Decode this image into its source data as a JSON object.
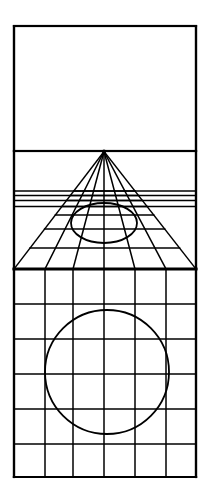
{
  "figure": {
    "title": "One-point perspective construction diagram",
    "background_color": "#ffffff",
    "stroke_color": "#000000"
  },
  "canvas": {
    "width": 209,
    "height": 499
  },
  "geometry": {
    "frame": {
      "left": 14,
      "right": 196,
      "top": 26,
      "bottom": 477,
      "stroke_width": 2.2
    },
    "horizon_line": {
      "y": 151,
      "stroke_width": 2.2,
      "label": "horizon-line"
    },
    "ground_line": {
      "y": 269,
      "stroke_width": 3.0,
      "label": "ground-line"
    },
    "vanishing_point": {
      "x": 104,
      "y": 151.5,
      "radius": 2.0,
      "label": "vanishing-point"
    },
    "upper_panel": {
      "top": 26,
      "bottom": 151,
      "left": 14,
      "right": 196,
      "label": "blank-sky-panel"
    },
    "perspective_panel": {
      "top": 151,
      "bottom": 269,
      "left": 14,
      "right": 196
    },
    "lower_grid_panel": {
      "top": 269,
      "bottom": 477,
      "left": 14,
      "right": 196
    },
    "column_x": [
      14,
      45,
      73,
      104,
      135,
      166,
      196
    ],
    "perspective_transversals_y": [
      191,
      195.5,
      200.5,
      206.5,
      215,
      229,
      248
    ],
    "lower_grid_rows_y": [
      269,
      304,
      339,
      374,
      409,
      444,
      477
    ],
    "lower_grid_columns_x": [
      14,
      45,
      73,
      104,
      135,
      166,
      196
    ],
    "ellipse": {
      "cx": 104,
      "cy": 223,
      "rx": 33,
      "ry": 20,
      "stroke_width": 1.8,
      "label": "perspective-ellipse"
    },
    "circle": {
      "cx": 107,
      "cy": 372,
      "r": 62,
      "stroke_width": 1.8,
      "label": "ground-plane-circle"
    },
    "orthogonal_line_count": 7,
    "transversal_line_count": 7,
    "grid_columns": 6,
    "grid_rows": 6
  }
}
